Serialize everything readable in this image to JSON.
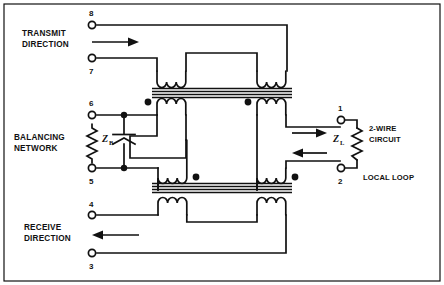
{
  "diagram": {
    "type": "schematic",
    "stroke_color": "#111111",
    "background_color": "#ffffff",
    "labels": {
      "transmit_line1": "TRANSMIT",
      "transmit_line2": "DIRECTION",
      "balancing_line1": "BALANCING",
      "balancing_line2": "NETWORK",
      "receive_line1": "RECEIVE",
      "receive_line2": "DIRECTION",
      "twowire_line1": "2-WIRE",
      "twowire_line2": "CIRCUIT",
      "local_loop": "LOCAL LOOP"
    },
    "impedances": {
      "balancing_symbol": "Z",
      "balancing_subscript": "B",
      "load_symbol": "Z",
      "load_subscript": "L"
    },
    "terminals": [
      {
        "number": "8",
        "side": "left",
        "group": "transmit",
        "x": 92,
        "y": 25
      },
      {
        "number": "7",
        "side": "left",
        "group": "transmit",
        "x": 92,
        "y": 58
      },
      {
        "number": "6",
        "side": "left",
        "group": "balancing",
        "x": 92,
        "y": 115
      },
      {
        "number": "5",
        "side": "left",
        "group": "balancing",
        "x": 92,
        "y": 168
      },
      {
        "number": "4",
        "side": "left",
        "group": "receive",
        "x": 92,
        "y": 215
      },
      {
        "number": "3",
        "side": "left",
        "group": "receive",
        "x": 92,
        "y": 253
      },
      {
        "number": "1",
        "side": "right",
        "group": "two-wire",
        "x": 340,
        "y": 120
      },
      {
        "number": "2",
        "side": "right",
        "group": "two-wire",
        "x": 340,
        "y": 168
      }
    ],
    "arrows": [
      {
        "name": "transmit-direction-arrow",
        "direction": "right"
      },
      {
        "name": "two-wire-out-arrow",
        "direction": "right"
      },
      {
        "name": "two-wire-in-arrow",
        "direction": "left"
      },
      {
        "name": "receive-direction-arrow",
        "direction": "left"
      }
    ],
    "polarity_dots": 4,
    "transformers": 2,
    "core_lines_per_transformer": 4
  }
}
